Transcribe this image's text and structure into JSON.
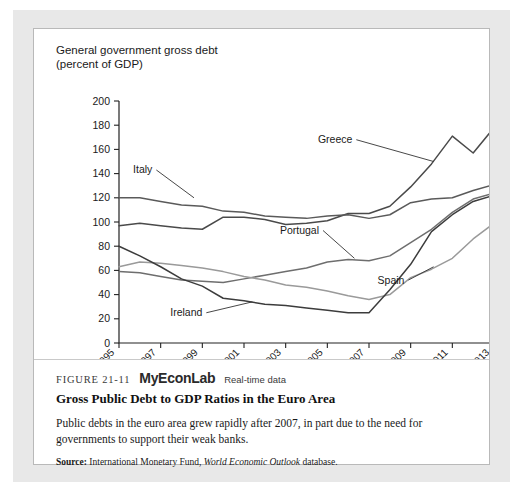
{
  "figure": {
    "number": "FIGURE 21-11",
    "brand": "MyEconLab",
    "brand_note": "Real-time data",
    "title": "Gross Public Debt to GDP Ratios in the Euro Area",
    "body": "Public debts in the euro area grew rapidly after 2007, in part due to the need for governments to support their weak banks.",
    "source_label": "Source:",
    "source_text_1": "International Monetary Fund,",
    "source_italic": "World Economic Outlook",
    "source_text_2": "database."
  },
  "chart_data": {
    "type": "line",
    "title": "General government gross debt\n(percent of GDP)",
    "xlabel": "",
    "ylabel": "",
    "ylim": [
      0,
      200
    ],
    "ytick_step": 20,
    "yticks": [
      0,
      20,
      40,
      60,
      80,
      100,
      120,
      140,
      160,
      180,
      200
    ],
    "xlim": [
      1995,
      2013
    ],
    "xticks": [
      1995,
      1997,
      1999,
      2001,
      2003,
      2005,
      2007,
      2009,
      2011,
      2013
    ],
    "x": [
      1995,
      1996,
      1997,
      1998,
      1999,
      2000,
      2001,
      2002,
      2003,
      2004,
      2005,
      2006,
      2007,
      2008,
      2009,
      2010,
      2011,
      2012,
      2013
    ],
    "grid": false,
    "legend_position": "inline-annotations",
    "series": [
      {
        "name": "Greece",
        "color": "#4a4a4a",
        "width": 1.5,
        "values": [
          97,
          99,
          97,
          95,
          94,
          104,
          104,
          102,
          98,
          99,
          101,
          107,
          107,
          113,
          129,
          148,
          171,
          157,
          178
        ],
        "label_x": 2006.2,
        "label_y": 168,
        "leader_to_x": 2010.1,
        "leader_to_y": 150
      },
      {
        "name": "Italy",
        "color": "#5a5a5a",
        "width": 1.5,
        "values": [
          120,
          120,
          117,
          114,
          113,
          109,
          108,
          105,
          104,
          103,
          105,
          106,
          103,
          106,
          116,
          119,
          120,
          126,
          131
        ],
        "label_x": 1996.6,
        "label_y": 143,
        "leader_to_x": 1998.6,
        "leader_to_y": 120
      },
      {
        "name": "Portugal",
        "color": "#6e6e6e",
        "width": 1.5,
        "values": [
          59,
          58,
          55,
          52,
          51,
          50,
          53,
          56,
          59,
          62,
          67,
          69,
          68,
          72,
          83,
          94,
          108,
          119,
          124
        ],
        "label_x": 2004.6,
        "label_y": 93,
        "leader_to_x": 2006.3,
        "leader_to_y": 70
      },
      {
        "name": "Spain",
        "color": "#9a9a9a",
        "width": 1.5,
        "values": [
          63,
          67,
          66,
          64,
          62,
          59,
          55,
          52,
          48,
          46,
          43,
          39,
          36,
          40,
          54,
          61,
          70,
          86,
          99
        ],
        "label_x": 2008.7,
        "label_y": 52,
        "leader_to_x": 2010.1,
        "leader_to_y": 63
      },
      {
        "name": "Ireland",
        "color": "#3c3c3c",
        "width": 1.5,
        "values": [
          80,
          72,
          63,
          53,
          47,
          37,
          35,
          32,
          31,
          29,
          27,
          25,
          25,
          44,
          65,
          92,
          106,
          117,
          122
        ],
        "label_x": 1999.0,
        "label_y": 25,
        "leader_to_x": 2001.4,
        "leader_to_y": 34
      }
    ]
  }
}
